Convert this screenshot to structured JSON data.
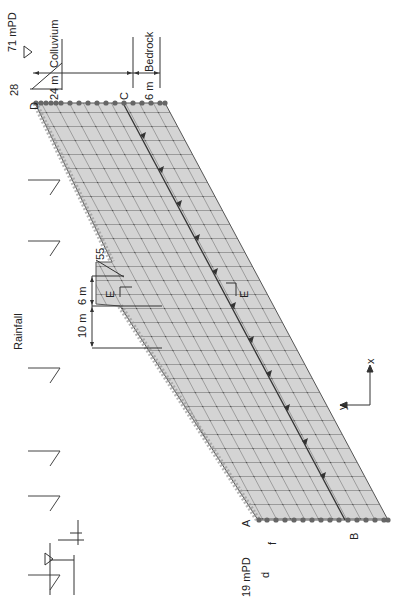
{
  "figure": {
    "orientation": "rotated -90deg",
    "colors": {
      "background": "#ffffff",
      "mesh_fill": "#d6d6d6",
      "mesh_line": "#555555",
      "node": "#666666",
      "annotation_line": "#333333"
    }
  },
  "labels": {
    "rainfall": "Rainfall",
    "top_elevation": "71 mPD",
    "toe_elevation": "19 mPD",
    "slope_angle_top": "28",
    "cut_angle": "55",
    "colluvium_thickness": "24 m",
    "colluvium": "Colluvium",
    "bedrock_thickness": "6 m",
    "bedrock": "Bedrock",
    "cut_height": "10 m",
    "berm_width": "6 m",
    "point_a": "A",
    "point_b": "B",
    "point_c": "C",
    "point_d": "D",
    "dim_d": "d",
    "dim_f": "f",
    "section_mark_1": "E",
    "section_mark_2": "E",
    "axis_x": "x",
    "axis_y": "y"
  },
  "rainfall_arrows": 6
}
